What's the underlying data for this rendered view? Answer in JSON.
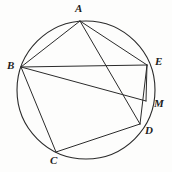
{
  "figure": {
    "kind": "circle-geometry-diagram",
    "canvas": {
      "width": 172,
      "height": 172
    },
    "stroke_color": "#2b2b2b",
    "background_color": "#fdfdfc",
    "circle": {
      "cx": 86,
      "cy": 90,
      "r": 69,
      "stroke_width": 1.1
    },
    "points": [
      {
        "id": "A",
        "label": "A",
        "x": 80,
        "y": 21,
        "label_x": 75,
        "label_y": 3,
        "on_circle": true
      },
      {
        "id": "B",
        "label": "B",
        "x": 21,
        "y": 67,
        "label_x": 7,
        "label_y": 60,
        "on_circle": true
      },
      {
        "id": "C",
        "label": "C",
        "x": 56,
        "y": 152,
        "label_x": 50,
        "label_y": 155,
        "on_circle": true
      },
      {
        "id": "D",
        "label": "D",
        "x": 140,
        "y": 124,
        "label_x": 145,
        "label_y": 125,
        "on_circle": true
      },
      {
        "id": "E",
        "label": "E",
        "x": 147,
        "y": 65,
        "label_x": 155,
        "label_y": 56,
        "on_circle": true
      },
      {
        "id": "M",
        "label": "M",
        "x": 146,
        "y": 101,
        "label_x": 154,
        "label_y": 98,
        "on_circle": false
      }
    ],
    "segments": [
      {
        "name": "chord-A-B",
        "from": "A",
        "to": "B"
      },
      {
        "name": "chord-A-E",
        "from": "A",
        "to": "E"
      },
      {
        "name": "chord-A-D",
        "from": "A",
        "to": "D"
      },
      {
        "name": "chord-B-E",
        "from": "B",
        "to": "E"
      },
      {
        "name": "chord-B-M",
        "from": "B",
        "to": "M"
      },
      {
        "name": "chord-B-C",
        "from": "B",
        "to": "C"
      },
      {
        "name": "chord-C-D",
        "from": "C",
        "to": "D"
      },
      {
        "name": "chord-E-D",
        "from": "E",
        "to": "D"
      },
      {
        "name": "chord-E-M",
        "from": "E",
        "to": "M"
      }
    ]
  }
}
